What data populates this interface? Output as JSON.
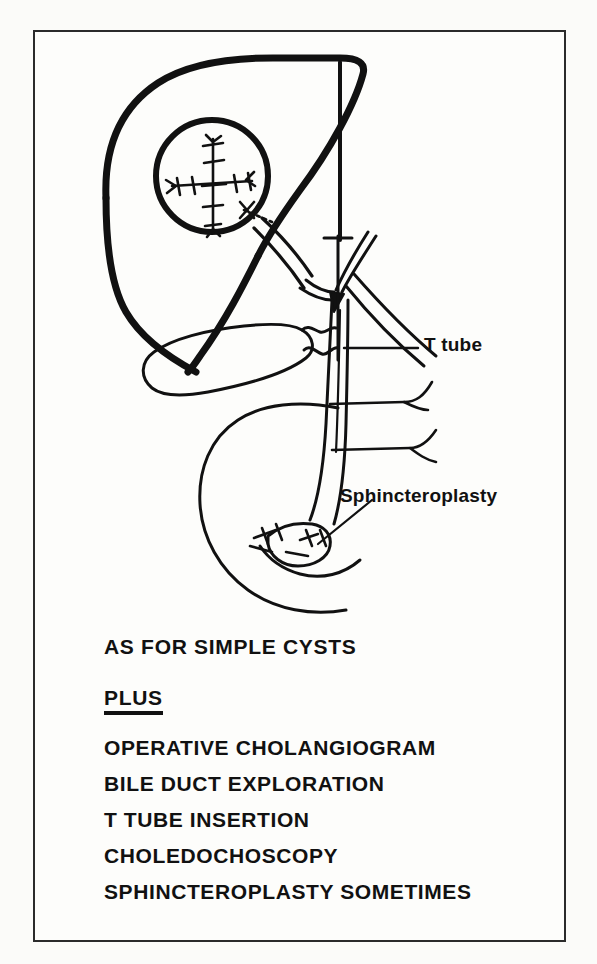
{
  "figure": {
    "kind": "medical-line-drawing",
    "annotations": [
      {
        "id": "t-tube",
        "label": "T tube"
      },
      {
        "id": "sphincteroplasty",
        "label": "Sphincteroplasty"
      }
    ],
    "structures": [
      "liver",
      "falciform-ligament",
      "hydatid-cyst-with-sutures",
      "gallbladder",
      "cystic-duct",
      "common-bile-duct",
      "hepatic-ducts",
      "duodenum",
      "pancreatic-duct-branches",
      "t-tube",
      "sphincteroplasty-sutures"
    ]
  },
  "text": {
    "heading": "AS FOR SIMPLE CYSTS",
    "plus": "PLUS",
    "items": [
      "OPERATIVE CHOLANGIOGRAM",
      "BILE DUCT EXPLORATION",
      "T TUBE INSERTION",
      "CHOLEDOCHOSCOPY",
      "SPHINCTEROPLASTY SOMETIMES"
    ]
  },
  "colors": {
    "ink": "#111111",
    "frame": "#2b2b2b",
    "paper": "#fdfdfb"
  }
}
